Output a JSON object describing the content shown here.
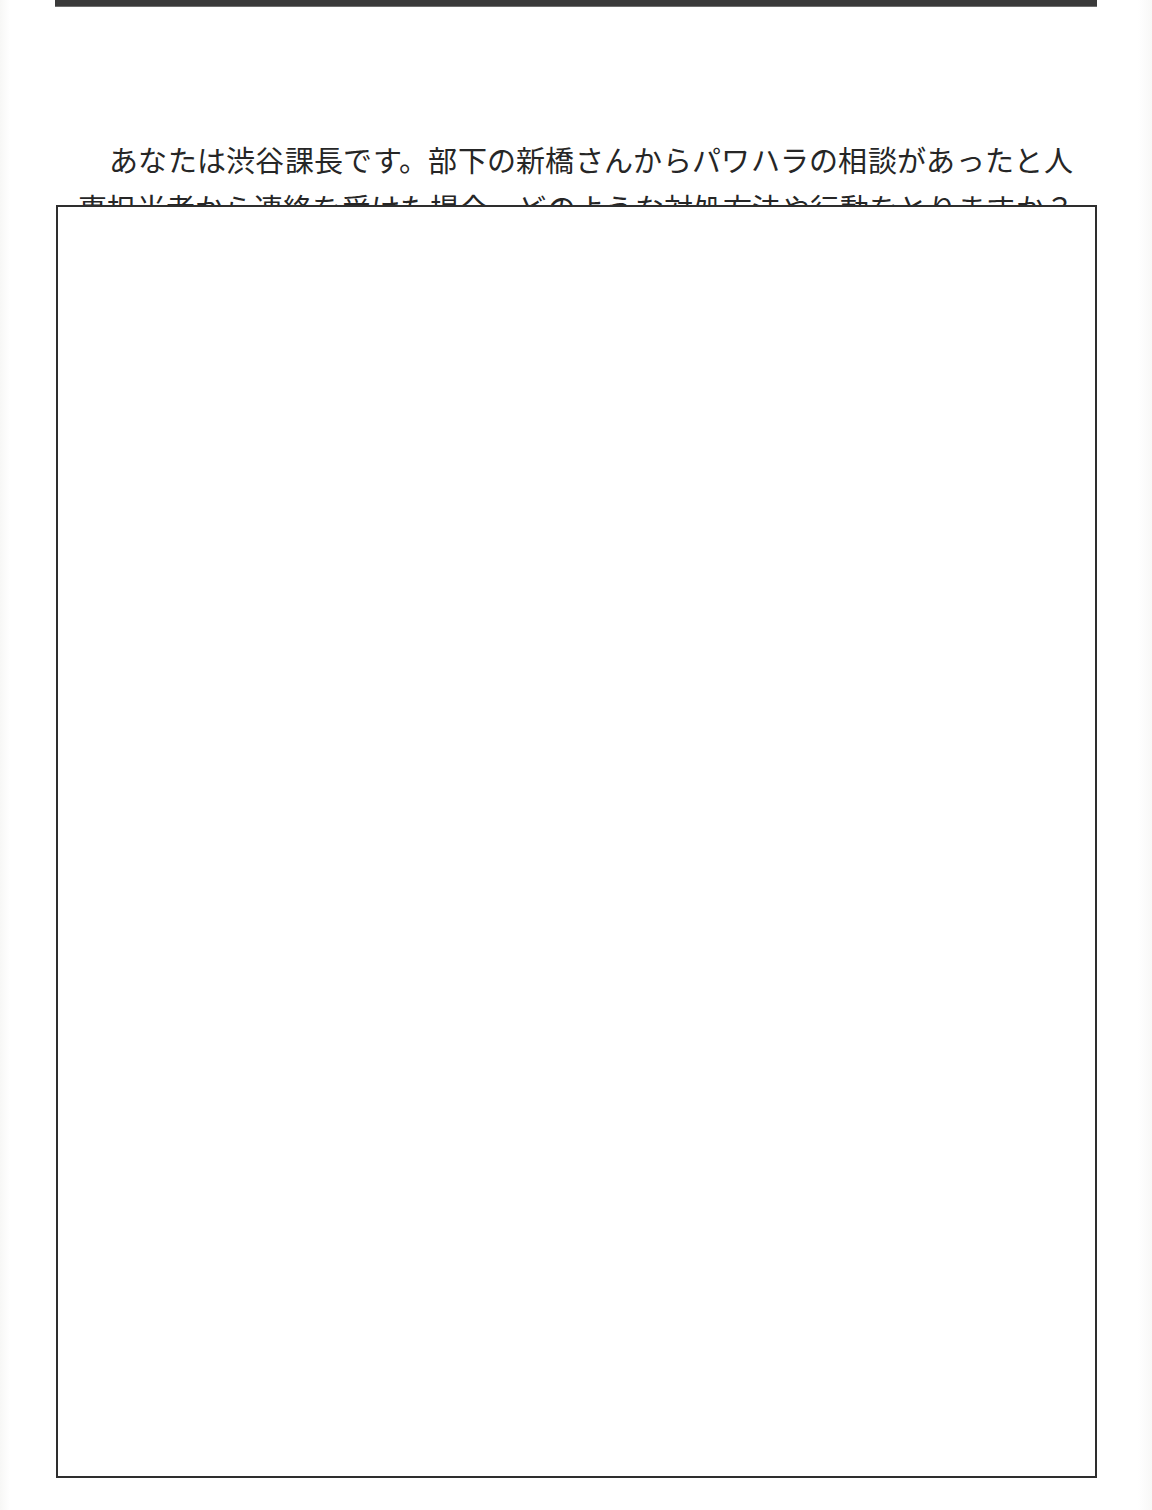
{
  "document": {
    "language": "ja",
    "page_background": "#ffffff",
    "ink_color": "#262626",
    "rule_color": "#3a3a3a",
    "box_border_color": "#2e2e2e"
  },
  "header": {
    "rule_label": "horizontal-rule"
  },
  "prompt": {
    "line_1": "あなたは渋谷課長です。部下の新橋さんからパワハラの相談があったと人事担当者から連絡を受けた場合、どのような対処方法や行動をとりますか？",
    "line_2": "それらについて具体的に書いてください。"
  },
  "answer_area": {
    "label": "answer-box",
    "value": "",
    "placeholder": ""
  }
}
